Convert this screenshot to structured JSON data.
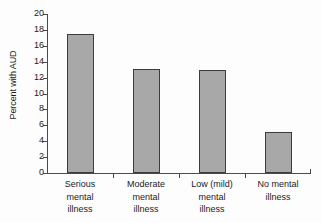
{
  "chart_data": {
    "type": "bar",
    "title": "",
    "xlabel": "",
    "ylabel": "Percent with AUD",
    "ylim": [
      0,
      20
    ],
    "ytick_values": [
      0,
      2,
      4,
      6,
      8,
      10,
      12,
      14,
      16,
      18,
      20
    ],
    "ytick_labels": [
      "0",
      "2",
      "4",
      "6",
      "8",
      "10",
      "12",
      "14",
      "16",
      "18",
      "20"
    ],
    "grid": false,
    "legend": null,
    "categories": [
      "Serious mental illness",
      "Moderate mental illness",
      "Low (mild) mental illness",
      "No mental illness"
    ],
    "category_lines": [
      [
        "Serious",
        "mental",
        "illness"
      ],
      [
        "Moderate",
        "mental",
        "illness"
      ],
      [
        "Low (mild)",
        "mental",
        "illness"
      ],
      [
        "No mental",
        "illness"
      ]
    ],
    "values": [
      17.5,
      13.1,
      12.9,
      5.1
    ],
    "bar_fill_color": "#a8a8a8",
    "bar_border_color": "#3c3c3c",
    "axis_color": "#4a4a4a",
    "background_color": "#fdfdfd"
  }
}
